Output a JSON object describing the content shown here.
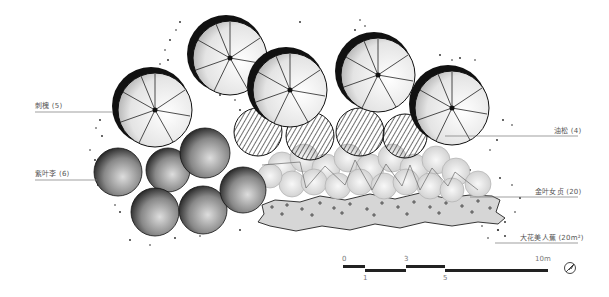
{
  "diagram": {
    "type": "landscape planting plan",
    "labels": {
      "left": [
        {
          "id": "robinia",
          "text": "刺槐 (5)",
          "x": 35,
          "y": 100,
          "line_y": 112,
          "line_x2": 113
        },
        {
          "id": "prunus",
          "text": "紫叶李 (6)",
          "x": 35,
          "y": 168,
          "line_y": 180,
          "line_x2": 97
        }
      ],
      "right": [
        {
          "id": "pinus",
          "text": "油松 (4)",
          "x": 554,
          "y": 125,
          "line_y": 136,
          "line_x1": 445
        },
        {
          "id": "ligustrum",
          "text": "金叶女贞 (20)",
          "x": 535,
          "y": 186,
          "line_y": 197,
          "line_x1": 470
        },
        {
          "id": "canna",
          "text": "大花美人蕉 (20m²)",
          "x": 525,
          "y": 232,
          "line_y": 243,
          "line_x1": 495
        }
      ]
    },
    "scale_bar": {
      "ticks_top": [
        "0",
        "3",
        "10m"
      ],
      "ticks_bottom": [
        "1",
        "5"
      ],
      "unit": "m"
    },
    "north_arrow": "north-arrow-icon",
    "colors": {
      "ink": "#111111",
      "label": "#555555",
      "bed_fill": "#d6d6d6",
      "hatch": "#444444"
    }
  }
}
